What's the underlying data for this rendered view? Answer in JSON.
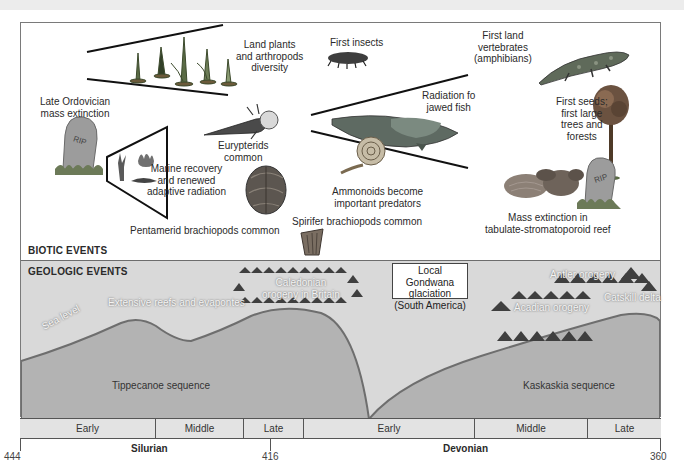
{
  "sections": {
    "biotic": "BIOTIC EVENTS",
    "geologic": "GEOLOGIC EVENTS"
  },
  "biotic_events": {
    "land_plants": "Land plants\nand arthropods\ndiversity",
    "first_insects": "First insects",
    "first_land_vertebrates": "First land\nvertebrates\n(amphibians)",
    "late_ordovician": "Late Ordovician\nmass extinction",
    "eurypterids": "Eurypterids\ncommon",
    "marine_recovery": "Marine recovery\nand renewed\nadaptive radiation",
    "jawed_fish": "Radiation fo\njawed fish",
    "first_seeds": "First seeds;\nfirst large\ntrees and\nforests",
    "ammonoids": "Ammonoids become\nimportant predators",
    "pentamerid": "Pentamerid brachiopods common",
    "spirifer": "Spirifer brachiopods common",
    "reef_extinction": "Mass extinction in\ntabulate-stromatoporoid reef",
    "rip_text": "RIP"
  },
  "geologic_events": {
    "caledonian": "Caledonian\norogeny in Britain",
    "reefs": "Extensive reefs and evapontes",
    "gondwana": "Local Gondwana\nglaciation\n(South America)",
    "antler": "Antler orogeny",
    "acadian": "Acadian orogeny",
    "catskill": "Catskill delta",
    "sea_level": "Sea level",
    "tippecanoe": "Tippecanoe sequence",
    "kaskaskia": "Kaskaskia sequence"
  },
  "timeline": {
    "epochs": [
      {
        "label": "Early",
        "width": 136
      },
      {
        "label": "Middle",
        "width": 88
      },
      {
        "label": "Late",
        "width": 60
      },
      {
        "label": "Early",
        "width": 171
      },
      {
        "label": "Middle",
        "width": 113
      },
      {
        "label": "Late",
        "width": 73
      }
    ],
    "periods": [
      "Silurian",
      "Devonian"
    ],
    "ticks": [
      "444",
      "416",
      "360"
    ]
  },
  "colors": {
    "geo_background": "#d9d9d9",
    "sequence_fill": "#b3b3b3",
    "sea_level_line": "#6e6e6e",
    "timeline_fill": "#e3e3e3"
  }
}
